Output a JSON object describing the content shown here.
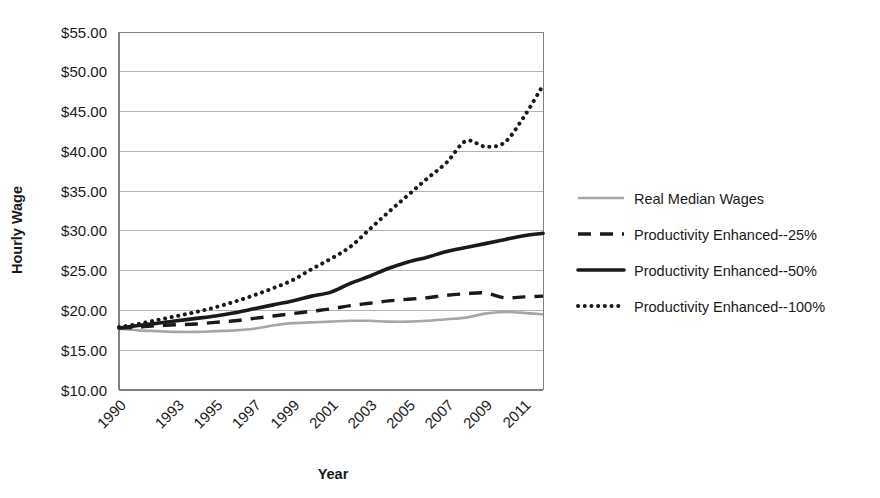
{
  "chart_data": {
    "type": "line",
    "title": "",
    "xlabel": "Year",
    "ylabel": "Hourly Wage",
    "xlim": [
      1990,
      2012
    ],
    "ylim": [
      10,
      55
    ],
    "ytick_labels": [
      "$55.00",
      "$50.00",
      "$45.00",
      "$40.00",
      "$35.00",
      "$30.00",
      "$25.00",
      "$20.00",
      "$15.00",
      "$10.00"
    ],
    "ytick_values": [
      55,
      50,
      45,
      40,
      35,
      30,
      25,
      20,
      15,
      10
    ],
    "xtick_labels": [
      "1990",
      "1993",
      "1995",
      "1997",
      "1999",
      "2001",
      "2003",
      "2005",
      "2007",
      "2009",
      "2011"
    ],
    "xtick_values": [
      1990,
      1993,
      1995,
      1997,
      1999,
      2001,
      2003,
      2005,
      2007,
      2009,
      2011
    ],
    "grid": true,
    "legend_position": "right",
    "x": [
      1990,
      1991,
      1992,
      1993,
      1994,
      1995,
      1996,
      1997,
      1998,
      1999,
      2000,
      2001,
      2002,
      2003,
      2004,
      2005,
      2006,
      2007,
      2008,
      2009,
      2010,
      2011,
      2012
    ],
    "series": [
      {
        "name": "Real Median Wages",
        "style": "solid-thin",
        "color": "#a6a6a6",
        "values": [
          17.7,
          17.5,
          17.4,
          17.3,
          17.3,
          17.4,
          17.5,
          17.7,
          18.1,
          18.4,
          18.5,
          18.6,
          18.7,
          18.7,
          18.6,
          18.6,
          18.7,
          18.9,
          19.1,
          19.6,
          19.8,
          19.7,
          19.5
        ]
      },
      {
        "name": "Productivity Enhanced--25%",
        "style": "dashed",
        "color": "#1a1a1a",
        "values": [
          17.8,
          17.9,
          18.1,
          18.2,
          18.3,
          18.5,
          18.7,
          19.0,
          19.3,
          19.6,
          19.9,
          20.2,
          20.6,
          20.9,
          21.2,
          21.4,
          21.6,
          21.9,
          22.1,
          22.2,
          21.6,
          21.7,
          21.8
        ]
      },
      {
        "name": "Productivity Enhanced--50%",
        "style": "solid-thick",
        "color": "#1a1a1a",
        "values": [
          17.8,
          18.1,
          18.4,
          18.7,
          19.0,
          19.3,
          19.7,
          20.2,
          20.7,
          21.2,
          21.8,
          22.3,
          23.4,
          24.3,
          25.3,
          26.1,
          26.7,
          27.4,
          27.9,
          28.4,
          28.9,
          29.4,
          29.7
        ]
      },
      {
        "name": "Productivity Enhanced--100%",
        "style": "dotted",
        "color": "#1a1a1a",
        "values": [
          17.9,
          18.3,
          18.8,
          19.3,
          19.8,
          20.4,
          21.1,
          21.9,
          22.8,
          23.8,
          25.2,
          26.5,
          28.0,
          30.2,
          32.4,
          34.5,
          36.6,
          38.6,
          41.3,
          40.6,
          41.1,
          44.3,
          48.3
        ]
      }
    ]
  },
  "legend": {
    "items": [
      {
        "label": "Real Median Wages",
        "style": "solid-thin",
        "color": "#a6a6a6"
      },
      {
        "label": "Productivity Enhanced--25%",
        "style": "dashed",
        "color": "#1a1a1a"
      },
      {
        "label": "Productivity Enhanced--50%",
        "style": "solid-thick",
        "color": "#1a1a1a"
      },
      {
        "label": "Productivity Enhanced--100%",
        "style": "dotted",
        "color": "#1a1a1a"
      }
    ]
  },
  "colors": {
    "gridline": "#b3b3b3",
    "axis": "#808080",
    "text": "#1a1a1a",
    "background": "#ffffff"
  }
}
